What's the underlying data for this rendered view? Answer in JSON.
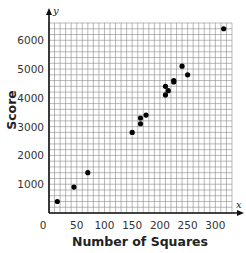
{
  "chart_data": {
    "type": "scatter",
    "title": "",
    "xlabel": "Number of Squares",
    "ylabel": "Score",
    "x_axis_var": "x",
    "y_axis_var": "y",
    "xlim": [
      0,
      330
    ],
    "ylim": [
      0,
      6600
    ],
    "x_ticks": [
      0,
      50,
      100,
      150,
      200,
      250,
      300
    ],
    "x_tick_labels": [
      "0",
      "50",
      "100",
      "150",
      "200",
      "250",
      "300"
    ],
    "y_ticks": [
      1000,
      2000,
      3000,
      4000,
      5000,
      6000
    ],
    "y_tick_labels": [
      "1000",
      "2000",
      "3000",
      "4000",
      "5000",
      "6000"
    ],
    "grid": true,
    "grid_minor_x": 10,
    "grid_minor_y": 200,
    "legend": null,
    "series": [
      {
        "name": "Score vs Number of Squares",
        "color": "#000000",
        "points": [
          {
            "x": 15,
            "y": 400
          },
          {
            "x": 45,
            "y": 900
          },
          {
            "x": 70,
            "y": 1400
          },
          {
            "x": 150,
            "y": 2800
          },
          {
            "x": 165,
            "y": 3100
          },
          {
            "x": 165,
            "y": 3300
          },
          {
            "x": 175,
            "y": 3400
          },
          {
            "x": 210,
            "y": 4100
          },
          {
            "x": 215,
            "y": 4250
          },
          {
            "x": 210,
            "y": 4400
          },
          {
            "x": 225,
            "y": 4550
          },
          {
            "x": 225,
            "y": 4600
          },
          {
            "x": 250,
            "y": 4800
          },
          {
            "x": 240,
            "y": 5100
          },
          {
            "x": 315,
            "y": 6400
          }
        ]
      }
    ]
  },
  "colors": {
    "grid": "#8a8a8a",
    "axis": "#111111",
    "point": "#000000",
    "background": "#ffffff"
  }
}
